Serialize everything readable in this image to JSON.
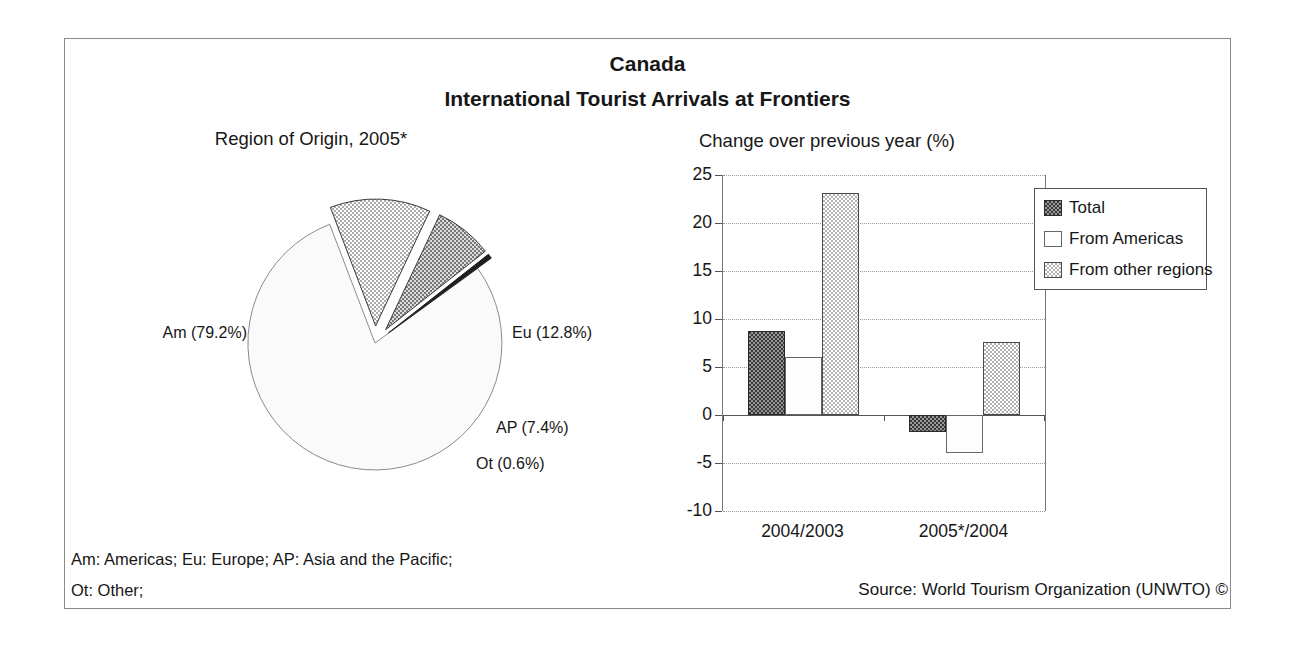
{
  "header": {
    "title": "Canada",
    "subtitle": "International Tourist Arrivals at Frontiers"
  },
  "chart_data": [
    {
      "type": "pie",
      "title": "Region of Origin, 2005*",
      "start_angle_deg": 36,
      "slices": [
        {
          "label": "Am (79.2%)",
          "region": "Americas",
          "value": 79.2,
          "pattern": "plain",
          "exploded": false
        },
        {
          "label": "Eu (12.8%)",
          "region": "Europe",
          "value": 12.8,
          "pattern": "checker-light",
          "exploded": true
        },
        {
          "label": "AP (7.4%)",
          "region": "Asia and the Pacific",
          "value": 7.4,
          "pattern": "checker-medium",
          "exploded": true
        },
        {
          "label": "Ot (0.6%)",
          "region": "Other",
          "value": 0.6,
          "pattern": "solid-dark",
          "exploded": true
        }
      ]
    },
    {
      "type": "bar",
      "title": "Change over previous year (%)",
      "categories": [
        "2004/2003",
        "2005*/2004"
      ],
      "series": [
        {
          "name": "Total",
          "pattern": "checker-dark",
          "values": [
            8.8,
            -1.8
          ]
        },
        {
          "name": "From Americas",
          "pattern": "plain-white",
          "values": [
            6.0,
            -4.0
          ]
        },
        {
          "name": "From other regions",
          "pattern": "checker-light",
          "values": [
            23.1,
            7.6
          ]
        }
      ],
      "ylim": [
        -10,
        25
      ],
      "ytick_step": 5,
      "yticks": [
        "25",
        "20",
        "15",
        "10",
        "5",
        "0",
        "-5",
        "-10"
      ],
      "grid": true,
      "legend_position": "top-right"
    }
  ],
  "footer": {
    "abbrev_line1": "Am: Americas; Eu: Europe; AP: Asia and the Pacific;",
    "abbrev_line2": "Ot: Other;",
    "source": "Source: World Tourism Organization (UNWTO) ©"
  }
}
